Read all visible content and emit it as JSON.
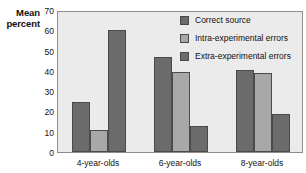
{
  "chart_data": {
    "type": "bar",
    "title": "",
    "subtitle": "",
    "xlabel": "",
    "ylabel": "Mean percent",
    "ylabel_lines": [
      "Mean",
      "percent"
    ],
    "categories": [
      "4-year-olds",
      "6-year-olds",
      "8-year-olds"
    ],
    "series": [
      {
        "name": "Correct source",
        "values": [
          24.5,
          47,
          40.5
        ],
        "color": "#6b6b6b"
      },
      {
        "name": "Intra-experimental errors",
        "values": [
          11,
          39.5,
          39
        ],
        "color": "#a8a8a8"
      },
      {
        "name": "Extra-experimental errors",
        "values": [
          60,
          13,
          18.5
        ],
        "color": "#6b6b6b"
      }
    ],
    "yticks": [
      0,
      10,
      20,
      30,
      40,
      50,
      60,
      70
    ],
    "ylim": [
      0,
      70
    ],
    "grid": false,
    "legend_position": "top-right",
    "plot_background": "#ebebeb",
    "frame_color": "#8c8c8c",
    "bar_edge_color": "#4a4a4a"
  }
}
